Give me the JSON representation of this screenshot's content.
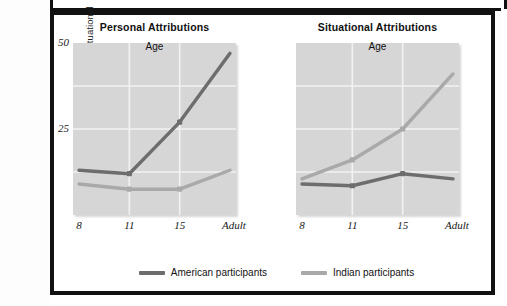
{
  "figure": {
    "y_axis_title": "Proportion of personal and situational attributions",
    "x_axis_title": "Age"
  },
  "legend": {
    "items": [
      {
        "label": "American participants",
        "color": "#6d6d6d",
        "key": "american"
      },
      {
        "label": "Indian participants",
        "color": "#a9a9a9",
        "key": "indian"
      }
    ]
  },
  "chart_data": [
    {
      "type": "line",
      "title": "Personal Attributions",
      "xlabel": "Age",
      "ylabel": "Proportion of personal and situational attributions",
      "categories": [
        "8",
        "11",
        "15",
        "Adult"
      ],
      "yticks": [
        "50",
        "25"
      ],
      "ytick_values": [
        50,
        25
      ],
      "ylim": [
        0,
        50
      ],
      "grid": true,
      "legend_position": "bottom",
      "series": [
        {
          "name": "American participants",
          "color": "#6d6d6d",
          "values": [
            13,
            12,
            27,
            47
          ]
        },
        {
          "name": "Indian participants",
          "color": "#a9a9a9",
          "values": [
            9,
            7.5,
            7.5,
            13
          ]
        }
      ]
    },
    {
      "type": "line",
      "title": "Situational Attributions",
      "xlabel": "Age",
      "ylabel": "",
      "categories": [
        "8",
        "11",
        "15",
        "Adult"
      ],
      "yticks": [],
      "ytick_values": [
        50,
        25
      ],
      "ylim": [
        0,
        50
      ],
      "grid": true,
      "legend_position": "bottom",
      "series": [
        {
          "name": "American participants",
          "color": "#6d6d6d",
          "values": [
            9,
            8.5,
            12,
            10.5
          ]
        },
        {
          "name": "Indian participants",
          "color": "#a9a9a9",
          "values": [
            10.5,
            16,
            25,
            41
          ]
        }
      ]
    }
  ]
}
